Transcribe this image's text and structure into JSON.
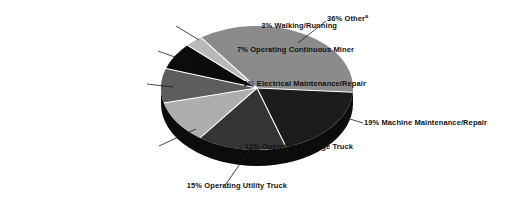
{
  "figure": {
    "background_color": "#ffffff",
    "text_color": "#111111"
  },
  "chart_data": {
    "type": "pie",
    "style": "3d",
    "title": "",
    "unit": "percent",
    "legend": "none",
    "separator_color": "#ffffff",
    "leader_line_color": "#1a1a1a",
    "rim_color": "#0c0c0c",
    "slices": [
      {
        "label": "36% Other",
        "sup": "a",
        "category": "Other",
        "value": 36,
        "color": "#8b8b8b"
      },
      {
        "label": "3% Walking/Running",
        "category": "Walking/Running",
        "value": 3,
        "color": "#b9b9b9"
      },
      {
        "label": "7% Operating Continuous Miner",
        "category": "Operating Continuous Miner",
        "value": 7,
        "color": "#0b0b0b"
      },
      {
        "label": "9% Electrical Maintenance/Repair",
        "category": "Electrical Maintenance/Repair",
        "value": 9,
        "color": "#5d5d5d"
      },
      {
        "label": "11% Operating Haulage Truck",
        "category": "Operating Haulage Truck",
        "value": 11,
        "color": "#aeaeae"
      },
      {
        "label": "15% Operating Utility Truck",
        "category": "Operating Utility Truck",
        "value": 15,
        "color": "#343434"
      },
      {
        "label": "19% Machine Maintenance/Repair",
        "category": "Machine Maintenance/Repair",
        "value": 19,
        "color": "#1c1c1c"
      }
    ]
  }
}
